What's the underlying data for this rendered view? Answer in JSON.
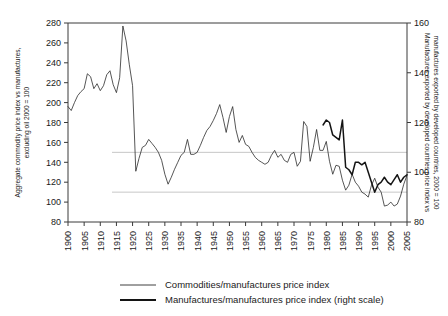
{
  "chart_data": {
    "type": "line",
    "title": "",
    "xlabel": "",
    "ylabel": "Aggregate commodity price index vs manufactures, excluding oil 2000 = 100",
    "ylabel_right": "Manufactures exported by developed countries price index vs manufactures exported by developed countries, 2000 = 100",
    "xlim": [
      1900,
      2005
    ],
    "ylim": [
      80,
      280
    ],
    "ylim_right": [
      80,
      160
    ],
    "grid": false,
    "legend_position": "bottom",
    "xticks": [
      1900,
      1905,
      1910,
      1915,
      1920,
      1925,
      1930,
      1935,
      1940,
      1945,
      1950,
      1955,
      1960,
      1965,
      1970,
      1975,
      1980,
      1985,
      1990,
      1995,
      2000,
      2005
    ],
    "yticks": [
      80,
      100,
      120,
      140,
      160,
      180,
      200,
      220,
      240,
      260,
      280
    ],
    "yticks_right": [
      80,
      100,
      120,
      140,
      160
    ],
    "reference_lines": [
      {
        "axis": "left",
        "value": 150
      },
      {
        "axis": "left",
        "value": 110
      }
    ],
    "series": [
      {
        "name": "Commodities/manufactures price index",
        "axis": "left",
        "style": "thin",
        "x": [
          1900,
          1901,
          1902,
          1903,
          1904,
          1905,
          1906,
          1907,
          1908,
          1909,
          1910,
          1911,
          1912,
          1913,
          1914,
          1915,
          1916,
          1917,
          1918,
          1919,
          1920,
          1921,
          1922,
          1923,
          1924,
          1925,
          1926,
          1927,
          1928,
          1929,
          1930,
          1931,
          1932,
          1933,
          1934,
          1935,
          1936,
          1937,
          1938,
          1939,
          1940,
          1941,
          1942,
          1943,
          1944,
          1945,
          1946,
          1947,
          1948,
          1949,
          1950,
          1951,
          1952,
          1953,
          1954,
          1955,
          1956,
          1957,
          1958,
          1959,
          1960,
          1961,
          1962,
          1963,
          1964,
          1965,
          1966,
          1967,
          1968,
          1969,
          1970,
          1971,
          1972,
          1973,
          1974,
          1975,
          1976,
          1977,
          1978,
          1979,
          1980,
          1981,
          1982,
          1983,
          1984,
          1985,
          1986,
          1987,
          1988,
          1989,
          1990,
          1991,
          1992,
          1993,
          1994,
          1995,
          1996,
          1997,
          1998,
          1999,
          2000,
          2001,
          2002,
          2003,
          2004,
          2005
        ],
        "values": [
          196,
          192,
          200,
          207,
          211,
          214,
          229,
          226,
          214,
          219,
          212,
          217,
          228,
          232,
          218,
          210,
          225,
          277,
          262,
          238,
          217,
          131,
          144,
          155,
          157,
          163,
          159,
          155,
          150,
          142,
          128,
          118,
          125,
          133,
          140,
          147,
          150,
          163,
          148,
          148,
          150,
          157,
          165,
          172,
          176,
          182,
          189,
          198,
          185,
          170,
          186,
          196,
          173,
          160,
          167,
          158,
          156,
          150,
          145,
          142,
          140,
          138,
          140,
          147,
          152,
          145,
          148,
          142,
          140,
          148,
          150,
          136,
          141,
          181,
          176,
          141,
          155,
          173,
          152,
          152,
          161,
          141,
          128,
          137,
          136,
          122,
          112,
          117,
          128,
          120,
          116,
          110,
          108,
          105,
          117,
          124,
          115,
          110,
          96,
          97,
          100,
          96,
          98,
          106,
          118,
          127
        ]
      },
      {
        "name": "Manufactures/manufactures price index (right scale)",
        "axis": "right",
        "style": "bold",
        "x": [
          1979,
          1980,
          1981,
          1982,
          1983,
          1984,
          1985,
          1986,
          1987,
          1988,
          1989,
          1990,
          1991,
          1992,
          1993,
          1994,
          1995,
          1996,
          1997,
          1998,
          1999,
          2000,
          2001,
          2002,
          2003,
          2004,
          2005
        ],
        "values": [
          119,
          121,
          120,
          115,
          114,
          113,
          121,
          102,
          101,
          99,
          104,
          104,
          103,
          104,
          100,
          96,
          92,
          95,
          96,
          98,
          96,
          95,
          97,
          99,
          96,
          98,
          99
        ]
      }
    ],
    "legend": [
      {
        "label": "Commodities/manufactures price index",
        "style": "thin"
      },
      {
        "label": "Manufactures/manufactures price index (right scale)",
        "style": "bold"
      }
    ]
  }
}
